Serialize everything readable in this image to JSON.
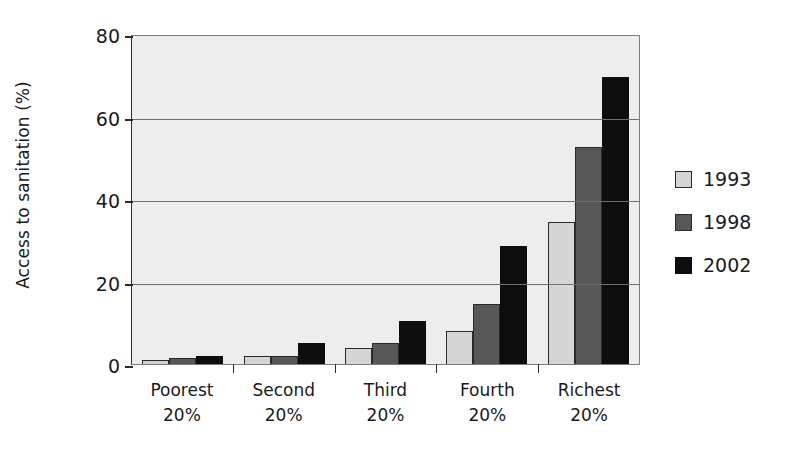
{
  "chart_data": {
    "type": "bar",
    "title": "",
    "subtitle": "",
    "xlabel": "",
    "ylabel": "Access to sanitation (%)",
    "ylim": [
      0,
      80
    ],
    "yticks": [
      0,
      20,
      40,
      60,
      80
    ],
    "ytick_labels": [
      "0",
      "20",
      "40",
      "60",
      "80"
    ],
    "grid": "horizontal",
    "legend_position": "right",
    "categories": [
      "Poorest 20%",
      "Second 20%",
      "Third 20%",
      "Fourth 20%",
      "Richest 20%"
    ],
    "category_lines": [
      [
        "Poorest",
        "20%"
      ],
      [
        "Second",
        "20%"
      ],
      [
        "Third",
        "20%"
      ],
      [
        "Fourth",
        "20%"
      ],
      [
        "Richest",
        "20%"
      ]
    ],
    "series": [
      {
        "name": "1993",
        "color": "#d5d5d5",
        "values": [
          1,
          2,
          4,
          8,
          34.5
        ]
      },
      {
        "name": "1998",
        "color": "#575757",
        "values": [
          1.5,
          2,
          5,
          14.5,
          52.5
        ]
      },
      {
        "name": "2002",
        "color": "#0d0d0d",
        "values": [
          2,
          5,
          10.5,
          28.5,
          69.5
        ]
      }
    ],
    "plot_background": "#ededed",
    "gridline_color": "#6f6f6f",
    "axis_color": "#2b2b2b"
  },
  "legend": {
    "entries": [
      {
        "label": "1993"
      },
      {
        "label": "1998"
      },
      {
        "label": "2002"
      }
    ]
  }
}
